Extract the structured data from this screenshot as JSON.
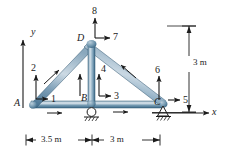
{
  "figure": {
    "background_color": "#ffffff",
    "line_color": "#1b1b1b",
    "member_color_light": "#cfdbe4",
    "member_color_mid": "#8fa9bd",
    "member_color_dark": "#4a7491"
  },
  "axes": {
    "y_label": "y",
    "x_label": "x"
  },
  "nodes": {
    "a": "A",
    "b": "B",
    "c": "C",
    "d": "D"
  },
  "forces": {
    "f1": "1",
    "f2": "2",
    "f3": "3",
    "f4": "4",
    "f5": "5",
    "f6": "6",
    "f7": "7",
    "f8": "8"
  },
  "dimensions": {
    "span_left": "3.5 m",
    "span_right": "3 m",
    "height": "3 m"
  },
  "supports": {
    "b_type": "roller-support",
    "c_type": "pin-support"
  }
}
